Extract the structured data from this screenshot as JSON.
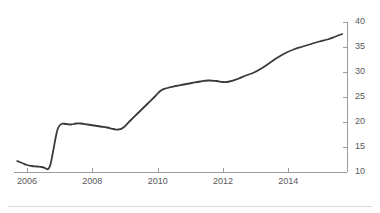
{
  "chart_data": {
    "type": "line",
    "title": "",
    "subtitle": "",
    "xlabel": "",
    "ylabel": "",
    "xlim": [
      2005.6,
      2015.8
    ],
    "ylim": [
      10,
      40
    ],
    "grid": false,
    "legend": null,
    "y_axis_position": "right",
    "x_tick_labels": [
      "2006",
      "2008",
      "2010",
      "2012",
      "2014"
    ],
    "x_ticks": [
      2006,
      2008,
      2010,
      2012,
      2014
    ],
    "y_tick_labels": [
      "10",
      "15",
      "20",
      "25",
      "30",
      "35",
      "40"
    ],
    "y_ticks": [
      10,
      15,
      20,
      25,
      30,
      35,
      40
    ],
    "series": [
      {
        "name": "series-1",
        "color": "#3a3a3a",
        "line_width": 1.8,
        "x": [
          2005.7,
          2005.85,
          2006.0,
          2006.15,
          2006.3,
          2006.45,
          2006.55,
          2006.65,
          2006.72,
          2006.8,
          2006.88,
          2006.95,
          2007.05,
          2007.2,
          2007.35,
          2007.5,
          2007.65,
          2007.85,
          2008.05,
          2008.25,
          2008.45,
          2008.65,
          2008.8,
          2008.95,
          2009.15,
          2009.4,
          2009.65,
          2009.9,
          2010.1,
          2010.3,
          2010.55,
          2010.8,
          2011.05,
          2011.3,
          2011.55,
          2011.8,
          2012.0,
          2012.2,
          2012.45,
          2012.7,
          2012.95,
          2013.2,
          2013.45,
          2013.7,
          2013.95,
          2014.2,
          2014.45,
          2014.7,
          2014.95,
          2015.2,
          2015.45,
          2015.65
        ],
        "y": [
          12.2,
          11.8,
          11.4,
          11.2,
          11.1,
          11.0,
          10.8,
          10.6,
          11.6,
          14.2,
          17.0,
          18.8,
          19.6,
          19.6,
          19.5,
          19.7,
          19.7,
          19.5,
          19.3,
          19.1,
          18.9,
          18.6,
          18.5,
          18.9,
          20.2,
          21.8,
          23.4,
          25.0,
          26.3,
          26.8,
          27.2,
          27.5,
          27.8,
          28.1,
          28.3,
          28.2,
          28.0,
          28.1,
          28.6,
          29.3,
          29.9,
          30.8,
          31.9,
          33.0,
          33.9,
          34.6,
          35.1,
          35.6,
          36.1,
          36.5,
          37.1,
          37.6
        ]
      }
    ]
  },
  "footer": {
    "rule_color": "#d8d8d8"
  }
}
